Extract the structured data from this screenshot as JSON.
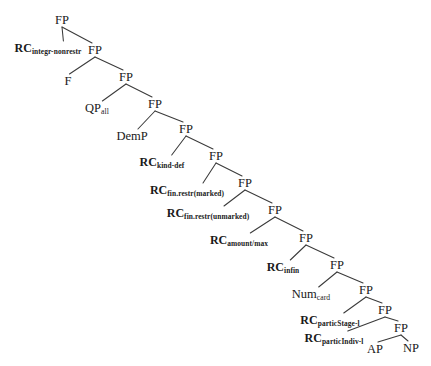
{
  "figure": {
    "type": "syntactic-tree",
    "background_color": "#ffffff",
    "text_color": "#1a1a1a",
    "line_color": "#3a3a3a",
    "width": 431,
    "height": 366
  },
  "spine_label": "FP",
  "nodes": [
    {
      "id": "fp1",
      "kind": "spine",
      "base": "FP",
      "sub": "",
      "x": 62,
      "y": 20
    },
    {
      "id": "fp2",
      "kind": "spine",
      "base": "FP",
      "sub": "",
      "x": 95,
      "y": 50
    },
    {
      "id": "fp3",
      "kind": "spine",
      "base": "FP",
      "sub": "",
      "x": 126,
      "y": 77
    },
    {
      "id": "fp4",
      "kind": "spine",
      "base": "FP",
      "sub": "",
      "x": 155,
      "y": 104
    },
    {
      "id": "fp5",
      "kind": "spine",
      "base": "FP",
      "sub": "",
      "x": 186,
      "y": 129
    },
    {
      "id": "fp6",
      "kind": "spine",
      "base": "FP",
      "sub": "",
      "x": 216,
      "y": 156
    },
    {
      "id": "fp7",
      "kind": "spine",
      "base": "FP",
      "sub": "",
      "x": 245,
      "y": 183
    },
    {
      "id": "fp8",
      "kind": "spine",
      "base": "FP",
      "sub": "",
      "x": 275,
      "y": 210
    },
    {
      "id": "fp9",
      "kind": "spine",
      "base": "FP",
      "sub": "",
      "x": 306,
      "y": 238
    },
    {
      "id": "fp10",
      "kind": "spine",
      "base": "FP",
      "sub": "",
      "x": 337,
      "y": 265
    },
    {
      "id": "fp11",
      "kind": "spine",
      "base": "FP",
      "sub": "",
      "x": 366,
      "y": 290
    },
    {
      "id": "fp12",
      "kind": "spine",
      "base": "FP",
      "sub": "",
      "x": 385,
      "y": 310
    },
    {
      "id": "fp13",
      "kind": "spine",
      "base": "FP",
      "sub": "",
      "x": 401,
      "y": 328
    },
    {
      "id": "rc1",
      "kind": "rc",
      "base": "RC",
      "sub": "integr-nonrestr",
      "x": 48,
      "y": 48
    },
    {
      "id": "f1",
      "kind": "term",
      "base": "F",
      "sub": "",
      "x": 68,
      "y": 81
    },
    {
      "id": "qp",
      "kind": "term",
      "base": "QP",
      "sub": "all",
      "x": 97,
      "y": 108
    },
    {
      "id": "demp",
      "kind": "term",
      "base": "DemP",
      "sub": "",
      "x": 132,
      "y": 136
    },
    {
      "id": "rc2",
      "kind": "rc",
      "base": "RC",
      "sub": "kind-def",
      "x": 162,
      "y": 162
    },
    {
      "id": "rc3",
      "kind": "rc",
      "base": "RC",
      "sub": "fin.restr(marked)",
      "x": 187,
      "y": 190
    },
    {
      "id": "rc4",
      "kind": "rc",
      "base": "RC",
      "sub": "fin.restr(unmarked)",
      "x": 208,
      "y": 213
    },
    {
      "id": "rc5",
      "kind": "rc",
      "base": "RC",
      "sub": "amount/max",
      "x": 239,
      "y": 240
    },
    {
      "id": "rc6",
      "kind": "rc",
      "base": "RC",
      "sub": "infin",
      "x": 283,
      "y": 267
    },
    {
      "id": "num",
      "kind": "term",
      "base": "Num",
      "sub": "card",
      "x": 311,
      "y": 294
    },
    {
      "id": "rc7",
      "kind": "rc",
      "base": "RC",
      "sub": "particStage-l",
      "x": 330,
      "y": 320
    },
    {
      "id": "rc8",
      "kind": "rc",
      "base": "RC",
      "sub": "particIndiv-l",
      "x": 334,
      "y": 338
    },
    {
      "id": "ap",
      "kind": "term",
      "base": "AP",
      "sub": "",
      "x": 375,
      "y": 349
    },
    {
      "id": "np",
      "kind": "term",
      "base": "NP",
      "sub": "",
      "x": 411,
      "y": 348
    }
  ],
  "edges": [
    {
      "from": "fp1",
      "to": "rc1",
      "role": "specifier"
    },
    {
      "from": "fp1",
      "to": "fp2",
      "role": "complement"
    },
    {
      "from": "fp2",
      "to": "f1",
      "role": "specifier"
    },
    {
      "from": "fp2",
      "to": "fp3",
      "role": "complement"
    },
    {
      "from": "fp3",
      "to": "qp",
      "role": "specifier"
    },
    {
      "from": "fp3",
      "to": "fp4",
      "role": "complement"
    },
    {
      "from": "fp4",
      "to": "demp",
      "role": "specifier"
    },
    {
      "from": "fp4",
      "to": "fp5",
      "role": "complement"
    },
    {
      "from": "fp5",
      "to": "rc2",
      "role": "specifier"
    },
    {
      "from": "fp5",
      "to": "fp6",
      "role": "complement"
    },
    {
      "from": "fp6",
      "to": "rc3",
      "role": "specifier"
    },
    {
      "from": "fp6",
      "to": "fp7",
      "role": "complement"
    },
    {
      "from": "fp7",
      "to": "rc4",
      "role": "specifier"
    },
    {
      "from": "fp7",
      "to": "fp8",
      "role": "complement"
    },
    {
      "from": "fp8",
      "to": "rc5",
      "role": "specifier"
    },
    {
      "from": "fp8",
      "to": "fp9",
      "role": "complement"
    },
    {
      "from": "fp9",
      "to": "rc6",
      "role": "specifier"
    },
    {
      "from": "fp9",
      "to": "fp10",
      "role": "complement"
    },
    {
      "from": "fp10",
      "to": "num",
      "role": "specifier"
    },
    {
      "from": "fp10",
      "to": "fp11",
      "role": "complement"
    },
    {
      "from": "fp11",
      "to": "rc7",
      "role": "specifier"
    },
    {
      "from": "fp11",
      "to": "fp12",
      "role": "complement"
    },
    {
      "from": "fp12",
      "to": "rc8",
      "role": "specifier"
    },
    {
      "from": "fp12",
      "to": "fp13",
      "role": "complement"
    },
    {
      "from": "fp13",
      "to": "ap",
      "role": "specifier"
    },
    {
      "from": "fp13",
      "to": "np",
      "role": "complement"
    }
  ]
}
